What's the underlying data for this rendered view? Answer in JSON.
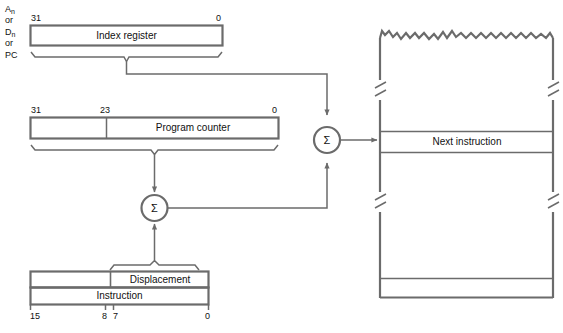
{
  "diagram": {
    "colors": {
      "line": "#6b6b6b",
      "box_border": "#6b6b6b",
      "text": "#111111",
      "background": "#ffffff"
    },
    "source_label": {
      "line1": "An",
      "line1_base": "A",
      "line1_sub": "n",
      "line2": "or",
      "line3_base": "D",
      "line3_sub": "n",
      "line4": "or",
      "line5": "PC"
    },
    "index_register": {
      "name": "Index register",
      "bit_high": "31",
      "bit_low": "0"
    },
    "program_counter": {
      "name": "Program counter",
      "bit_high": "31",
      "bit_mid": "23",
      "bit_low": "0"
    },
    "instruction_word": {
      "displacement_label": "Displacement",
      "instruction_label": "Instruction",
      "bit_15": "15",
      "bit_8": "8",
      "bit_7": "7",
      "bit_0": "0"
    },
    "adders": [
      {
        "id": "lower-adder",
        "symbol": "Σ"
      },
      {
        "id": "upper-adder",
        "symbol": "Σ"
      }
    ],
    "memory": {
      "next_instruction": "Next instruction"
    }
  }
}
